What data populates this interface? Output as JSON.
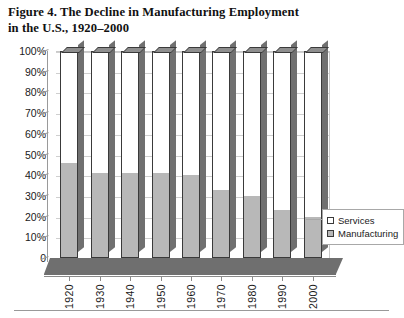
{
  "figure": {
    "caption_line1": "Figure 4. The Decline in Manufacturing Employment",
    "caption_line2": "in the U.S., 1920–2000"
  },
  "legend": {
    "position": "right-middle",
    "items": [
      {
        "label": "Services",
        "swatch": "white-square-swatch",
        "color": "#ffffff"
      },
      {
        "label": "Manufacturing",
        "swatch": "gray-square-swatch",
        "color": "#b8b8b8"
      }
    ]
  },
  "axes": {
    "y_ticks": [
      "100%",
      "90%",
      "80%",
      "70%",
      "60%",
      "50%",
      "40%",
      "30%",
      "20%",
      "10%",
      "0"
    ],
    "x_ticks": [
      "1920",
      "1930",
      "1940",
      "1950",
      "1960",
      "1970",
      "1980",
      "1990",
      "2000"
    ]
  },
  "colors": {
    "manufacturing": "#b8b8b8",
    "services": "#ffffff",
    "bar_outline": "#3a3a3a",
    "bar_side_3d": "#707070",
    "bar_top_3d": "#8e8e8e",
    "floor_3d": "#6f6f6f",
    "gridline": "#cfcfcf",
    "axis": "#9a9a9a"
  },
  "chart_data": {
    "type": "bar",
    "title": "Figure 4. The Decline in Manufacturing Employment in the U.S., 1920–2000",
    "subtitle": "",
    "xlabel": "",
    "ylabel": "",
    "stacked": true,
    "stacked_percent": true,
    "grid": true,
    "legend_position": "right",
    "ylim": [
      0,
      100
    ],
    "ytick_values": [
      0,
      10,
      20,
      30,
      40,
      50,
      60,
      70,
      80,
      90,
      100
    ],
    "ytick_labels": [
      "0",
      "10%",
      "20%",
      "30%",
      "40%",
      "50%",
      "60%",
      "70%",
      "80%",
      "90%",
      "100%"
    ],
    "categories": [
      "1920",
      "1930",
      "1940",
      "1950",
      "1960",
      "1970",
      "1980",
      "1990",
      "2000"
    ],
    "series": [
      {
        "name": "Manufacturing",
        "color": "#b8b8b8",
        "values": [
          46,
          41,
          41,
          41,
          40,
          33,
          30,
          23,
          20
        ]
      },
      {
        "name": "Services",
        "color": "#ffffff",
        "values": [
          54,
          59,
          59,
          59,
          60,
          67,
          70,
          77,
          80
        ]
      }
    ]
  }
}
